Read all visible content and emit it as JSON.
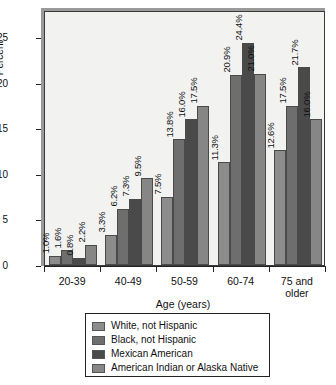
{
  "chart_data": {
    "type": "bar",
    "title": "",
    "xlabel": "Age (years)",
    "ylabel": "Percent",
    "categories": [
      "20-39",
      "40-49",
      "50-59",
      "60-74",
      "75 and older"
    ],
    "ylim": [
      0,
      28
    ],
    "yticks": [
      0,
      5,
      10,
      15,
      20,
      25
    ],
    "ytick_labels": [
      "0",
      "5",
      "10",
      "15",
      "20",
      "25"
    ],
    "grid": false,
    "legend_position": "below",
    "value_label_suffix": "%",
    "series": [
      {
        "name": "White, not Hispanic",
        "color": "#8c8c8c",
        "values": [
          1.0,
          3.3,
          7.5,
          11.3,
          12.6
        ],
        "labels": [
          "1.0%",
          "3.3%",
          "7.5%",
          "11.3%",
          "12.6%"
        ]
      },
      {
        "name": "Black, not Hispanic",
        "color": "#6e6e6e",
        "values": [
          1.6,
          6.2,
          13.8,
          20.9,
          17.5
        ],
        "labels": [
          "1.6%",
          "6.2%",
          "13.8%",
          "20.9%",
          "17.5%"
        ]
      },
      {
        "name": "Mexican American",
        "color": "#4a4a4a",
        "values": [
          0.8,
          7.3,
          16.0,
          24.4,
          21.7
        ],
        "labels": [
          "0.8%",
          "7.3%",
          "16.0%",
          "24.4%",
          "21.7%"
        ]
      },
      {
        "name": "American Indian or Alaska Native",
        "color": "#868686",
        "values": [
          2.2,
          9.5,
          17.5,
          21.0,
          16.0
        ],
        "labels": [
          "2.2%",
          "9.5%",
          "17.5%",
          "21.0%",
          "16.0%"
        ]
      }
    ]
  }
}
